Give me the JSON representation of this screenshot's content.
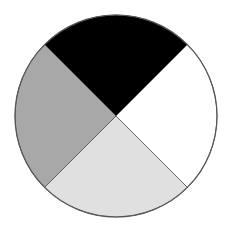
{
  "chart_data": {
    "type": "pie",
    "title": "",
    "categories": [
      "Top",
      "Right",
      "Bottom",
      "Left"
    ],
    "values": [
      25,
      25,
      25,
      25
    ],
    "colors": [
      "#000000",
      "#ffffff",
      "#e0e0e0",
      "#a8a8a8"
    ],
    "legend": null,
    "labels_shown": false,
    "outline_color": "#555555",
    "center": [
      116,
      116
    ],
    "radius": 101
  }
}
